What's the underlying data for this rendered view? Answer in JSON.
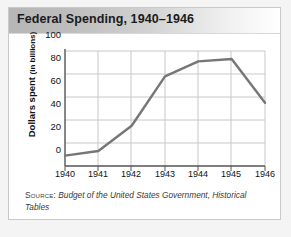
{
  "card": {
    "title": "Federal Spending, 1940–1946"
  },
  "source": {
    "label": "Source:",
    "text": "Budget of the United States Government, Historical Tables"
  },
  "chart_data": {
    "type": "line",
    "title": "Federal Spending, 1940–1946",
    "xlabel": "",
    "ylabel": "Dollars spent (in billions)",
    "ylabel_main": "Dollars spent",
    "ylabel_sub": "(in billions)",
    "categories": [
      "1940",
      "1941",
      "1942",
      "1943",
      "1944",
      "1945",
      "1946"
    ],
    "values": [
      9,
      13,
      35,
      78,
      91,
      93,
      55
    ],
    "ylim": [
      0,
      100
    ],
    "yticks": [
      100,
      80,
      60,
      40,
      20,
      0
    ],
    "grid": true,
    "legend": "none",
    "line_color": "#767676",
    "grid_color": "#c8c8c8",
    "axis_color": "#555555"
  }
}
